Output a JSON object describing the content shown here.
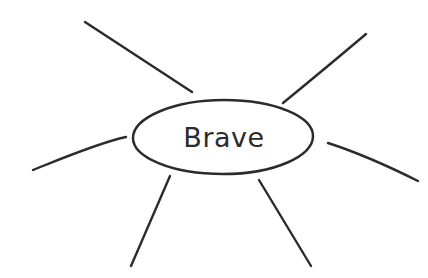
{
  "canvas": {
    "width": 428,
    "height": 278,
    "background_color": "#ffffff"
  },
  "diagram": {
    "type": "mind-map",
    "ink_color": "#2b2b2b",
    "stroke_width": 2.4,
    "center_node": {
      "label": "Brave",
      "shape": "ellipse",
      "cx": 223,
      "cy": 137,
      "rx": 90,
      "ry": 37,
      "fill_color": "#ffffff",
      "text_color": "#2b2b2b",
      "font_size": 27,
      "path": "M 133 138 C 133 118 173 100 224 100 C 276 100 313 117 313 136 C 313 156 275 174 223 174 C 171 174 133 157 133 138 Z"
    },
    "spokes": [
      {
        "name": "branch-upper-left",
        "path": "M 85 22 L 192 92",
        "x1": 85,
        "y1": 22,
        "x2": 192,
        "y2": 92
      },
      {
        "name": "branch-upper-right",
        "path": "M 283 103 C 305 85 340 56 366 34",
        "x1": 283,
        "y1": 103,
        "x2": 366,
        "y2": 34
      },
      {
        "name": "branch-left",
        "path": "M 33 170 C 58 160 98 143 126 137",
        "x1": 33,
        "y1": 170,
        "x2": 126,
        "y2": 137
      },
      {
        "name": "branch-right",
        "path": "M 328 143 C 356 152 394 169 418 181",
        "x1": 328,
        "y1": 143,
        "x2": 418,
        "y2": 181
      },
      {
        "name": "branch-lower-left",
        "path": "M 170 176 L 131 266",
        "x1": 170,
        "y1": 176,
        "x2": 131,
        "y2": 266
      },
      {
        "name": "branch-lower-right",
        "path": "M 259 180 L 311 266",
        "x1": 259,
        "y1": 180,
        "x2": 311,
        "y2": 266
      }
    ]
  }
}
